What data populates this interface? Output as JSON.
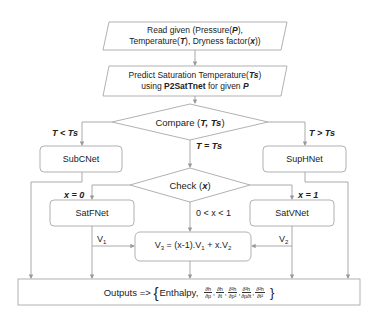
{
  "nodes": {
    "read": {
      "line1_pre": "Read given (Pressure(",
      "line1_var": "P",
      "line1_post": "),",
      "line2_a": "Temperature(",
      "line2_var1": "T",
      "line2_b": "), Dryness factor(",
      "line2_var2": "x",
      "line2_c": "))"
    },
    "predict": {
      "line1_pre": "Predict Saturation  Temperature(",
      "line1_var": "Ts",
      "line1_post": ")",
      "line2_pre": "using ",
      "line2_bold": "P2SatTnet",
      "line2_mid": " for given ",
      "line2_var": "P"
    },
    "compare": {
      "pre": "Compare (",
      "vars": "T, Ts",
      "post": ")"
    },
    "subcnet": {
      "label": "SubCNet"
    },
    "suphnet": {
      "label": "SupHNet"
    },
    "check": {
      "pre": "Check (",
      "var": "x",
      "post": ")"
    },
    "satfnet": {
      "label": "SatFNet"
    },
    "satvnet": {
      "label": "SatVNet"
    },
    "combine": {
      "v3": "V",
      "v3_sub": "3",
      "eq": " = (x-1).V",
      "v1_sub": "1",
      "plus": " + x.V",
      "v2_sub": "2"
    },
    "outputs": {
      "prefix": "Outputs => ",
      "brace_open": "{",
      "enthalpy": "Enthalpy,",
      "brace_close": "}",
      "derivatives": [
        {
          "num": "∂h",
          "den": "∂p"
        },
        {
          "num": "∂h",
          "den": "∂t"
        },
        {
          "num": "∂²h",
          "den": "∂p²"
        },
        {
          "num": "∂²h",
          "den": "∂p∂t"
        },
        {
          "num": "∂²h",
          "den": "∂t²"
        }
      ]
    }
  },
  "edges": {
    "t_less": "T < Ts",
    "t_equal": "T = Ts",
    "t_greater": "T > Ts",
    "x_zero": "x = 0",
    "x_between": "0 < x < 1",
    "x_one": "x = 1",
    "v1": "V",
    "v1_sub": "1",
    "v2": "V",
    "v2_sub": "2"
  },
  "colors": {
    "stroke": "#a0a0a0",
    "arrow": "#9a9a9a",
    "text": "#222222",
    "fill": "#ffffff"
  }
}
